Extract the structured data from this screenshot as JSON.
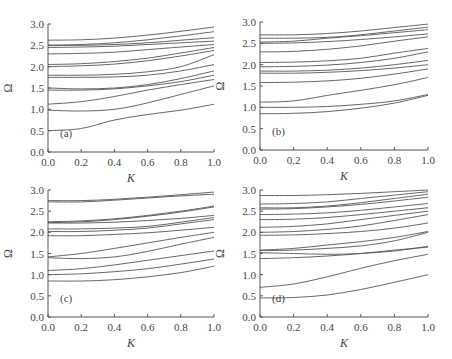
{
  "chart_data": [
    {
      "type": "line",
      "panel_label": "(a)",
      "xlabel": "K",
      "ylabel": "Ω",
      "xlim": [
        0,
        1
      ],
      "ylim": [
        0,
        3
      ],
      "x_ticks": [
        "0.0",
        "0.2",
        "0.4",
        "0.6",
        "0.8",
        "1.0"
      ],
      "y_ticks": [
        "0.0",
        "0.5",
        "1.0",
        "1.5",
        "2.0",
        "2.5",
        "3.0"
      ],
      "x": [
        0,
        0.2,
        0.4,
        0.6,
        0.8,
        1.0
      ],
      "series": [
        {
          "values": [
            2.62,
            2.63,
            2.67,
            2.74,
            2.83,
            2.93
          ]
        },
        {
          "values": [
            2.5,
            2.52,
            2.56,
            2.63,
            2.72,
            2.82
          ]
        },
        {
          "values": [
            2.5,
            2.5,
            2.52,
            2.56,
            2.62,
            2.68
          ]
        },
        {
          "values": [
            2.45,
            2.46,
            2.48,
            2.52,
            2.56,
            2.6
          ]
        },
        {
          "values": [
            2.3,
            2.31,
            2.34,
            2.4,
            2.46,
            2.52
          ]
        },
        {
          "values": [
            2.05,
            2.07,
            2.12,
            2.2,
            2.32,
            2.45
          ]
        },
        {
          "values": [
            2.0,
            2.02,
            2.06,
            2.14,
            2.25,
            2.38
          ]
        },
        {
          "values": [
            1.8,
            1.8,
            1.82,
            1.88,
            2.0,
            2.28
          ]
        },
        {
          "values": [
            1.75,
            1.75,
            1.76,
            1.8,
            1.9,
            2.05
          ]
        },
        {
          "values": [
            1.5,
            1.48,
            1.5,
            1.58,
            1.72,
            1.9
          ]
        },
        {
          "values": [
            1.45,
            1.45,
            1.48,
            1.55,
            1.65,
            1.8
          ]
        },
        {
          "values": [
            1.12,
            1.18,
            1.3,
            1.45,
            1.58,
            1.7
          ]
        },
        {
          "values": [
            0.98,
            0.96,
            1.0,
            1.15,
            1.35,
            1.55
          ]
        },
        {
          "values": [
            0.5,
            0.55,
            0.75,
            0.88,
            0.98,
            1.12
          ]
        }
      ]
    },
    {
      "type": "line",
      "panel_label": "(b)",
      "xlabel": "K",
      "ylabel": "Ω",
      "xlim": [
        0,
        1
      ],
      "ylim": [
        0,
        3
      ],
      "x_ticks": [
        "0.0",
        "0.2",
        "0.4",
        "0.6",
        "0.8",
        "1.0"
      ],
      "y_ticks": [
        "0.0",
        "0.5",
        "1.0",
        "1.5",
        "2.0",
        "2.5",
        "3.0"
      ],
      "x": [
        0,
        0.2,
        0.4,
        0.6,
        0.8,
        1.0
      ],
      "series": [
        {
          "values": [
            2.7,
            2.7,
            2.73,
            2.79,
            2.87,
            2.95
          ]
        },
        {
          "values": [
            2.62,
            2.62,
            2.64,
            2.7,
            2.79,
            2.88
          ]
        },
        {
          "values": [
            2.53,
            2.55,
            2.62,
            2.68,
            2.75,
            2.82
          ]
        },
        {
          "values": [
            2.5,
            2.51,
            2.54,
            2.59,
            2.65,
            2.72
          ]
        },
        {
          "values": [
            2.3,
            2.31,
            2.36,
            2.44,
            2.55,
            2.65
          ]
        },
        {
          "values": [
            2.05,
            2.06,
            2.09,
            2.15,
            2.27,
            2.38
          ]
        },
        {
          "values": [
            1.95,
            1.96,
            1.99,
            2.05,
            2.15,
            2.3
          ]
        },
        {
          "values": [
            1.85,
            1.85,
            1.87,
            1.92,
            2.0,
            2.1
          ]
        },
        {
          "values": [
            1.8,
            1.8,
            1.82,
            1.86,
            1.92,
            2.0
          ]
        },
        {
          "values": [
            1.58,
            1.59,
            1.62,
            1.68,
            1.78,
            1.9
          ]
        },
        {
          "values": [
            1.12,
            1.15,
            1.28,
            1.4,
            1.53,
            1.7
          ]
        },
        {
          "values": [
            1.0,
            1.0,
            1.02,
            1.07,
            1.15,
            1.3
          ]
        },
        {
          "values": [
            0.85,
            0.86,
            0.9,
            0.98,
            1.1,
            1.28
          ]
        }
      ]
    },
    {
      "type": "line",
      "panel_label": "(c)",
      "xlabel": "K",
      "ylabel": "Ω",
      "xlim": [
        0,
        1
      ],
      "ylim": [
        0,
        3
      ],
      "x_ticks": [
        "0.0",
        "0.2",
        "0.4",
        "0.6",
        "0.8",
        "1.0"
      ],
      "y_ticks": [
        "0.0",
        "0.5",
        "1.0",
        "1.5",
        "2.0",
        "2.5",
        "3.0"
      ],
      "x": [
        0,
        0.2,
        0.4,
        0.6,
        0.8,
        1.0
      ],
      "series": [
        {
          "values": [
            2.75,
            2.75,
            2.78,
            2.83,
            2.89,
            2.95
          ]
        },
        {
          "values": [
            2.72,
            2.72,
            2.76,
            2.81,
            2.86,
            2.9
          ]
        },
        {
          "values": [
            2.25,
            2.27,
            2.32,
            2.4,
            2.5,
            2.62
          ]
        },
        {
          "values": [
            2.23,
            2.25,
            2.3,
            2.38,
            2.48,
            2.6
          ]
        },
        {
          "values": [
            2.22,
            2.22,
            2.24,
            2.28,
            2.33,
            2.4
          ]
        },
        {
          "values": [
            2.08,
            2.08,
            2.1,
            2.14,
            2.24,
            2.35
          ]
        },
        {
          "values": [
            2.02,
            2.02,
            2.05,
            2.1,
            2.2,
            2.3
          ]
        },
        {
          "values": [
            1.92,
            1.92,
            1.95,
            1.99,
            2.05,
            2.12
          ]
        },
        {
          "values": [
            1.42,
            1.5,
            1.62,
            1.75,
            1.88,
            2.0
          ]
        },
        {
          "values": [
            1.4,
            1.38,
            1.42,
            1.55,
            1.72,
            1.88
          ]
        },
        {
          "values": [
            1.1,
            1.14,
            1.23,
            1.34,
            1.45,
            1.56
          ]
        },
        {
          "values": [
            1.0,
            1.02,
            1.07,
            1.14,
            1.25,
            1.37
          ]
        },
        {
          "values": [
            0.85,
            0.85,
            0.88,
            0.95,
            1.05,
            1.2
          ]
        }
      ]
    },
    {
      "type": "line",
      "panel_label": "(d)",
      "xlabel": "K",
      "ylabel": "Ω",
      "xlim": [
        0,
        1
      ],
      "ylim": [
        0,
        3
      ],
      "x_ticks": [
        "0.0",
        "0.2",
        "0.4",
        "0.6",
        "0.8",
        "1.0"
      ],
      "y_ticks": [
        "0.0",
        "0.5",
        "1.0",
        "1.5",
        "2.0",
        "2.5",
        "3.0"
      ],
      "x": [
        0,
        0.2,
        0.4,
        0.6,
        0.8,
        1.0
      ],
      "series": [
        {
          "values": [
            2.87,
            2.87,
            2.89,
            2.92,
            2.96,
            3.0
          ]
        },
        {
          "values": [
            2.67,
            2.68,
            2.72,
            2.8,
            2.88,
            2.96
          ]
        },
        {
          "values": [
            2.58,
            2.58,
            2.62,
            2.7,
            2.8,
            2.9
          ]
        },
        {
          "values": [
            2.55,
            2.56,
            2.6,
            2.66,
            2.74,
            2.83
          ]
        },
        {
          "values": [
            2.42,
            2.43,
            2.46,
            2.52,
            2.6,
            2.68
          ]
        },
        {
          "values": [
            2.3,
            2.31,
            2.35,
            2.42,
            2.5,
            2.58
          ]
        },
        {
          "values": [
            2.12,
            2.14,
            2.2,
            2.3,
            2.4,
            2.5
          ]
        },
        {
          "values": [
            2.0,
            2.02,
            2.07,
            2.15,
            2.28,
            2.42
          ]
        },
        {
          "values": [
            1.93,
            1.94,
            1.97,
            2.02,
            2.1,
            2.22
          ]
        },
        {
          "values": [
            1.58,
            1.62,
            1.7,
            1.78,
            1.88,
            2.02
          ]
        },
        {
          "values": [
            1.57,
            1.58,
            1.62,
            1.68,
            1.8,
            2.0
          ]
        },
        {
          "values": [
            1.52,
            1.5,
            1.48,
            1.5,
            1.56,
            1.67
          ]
        },
        {
          "values": [
            1.38,
            1.4,
            1.44,
            1.5,
            1.58,
            1.65
          ]
        },
        {
          "values": [
            0.7,
            0.78,
            0.95,
            1.15,
            1.33,
            1.48
          ]
        },
        {
          "values": [
            0.45,
            0.46,
            0.52,
            0.65,
            0.82,
            1.0
          ]
        }
      ]
    }
  ]
}
